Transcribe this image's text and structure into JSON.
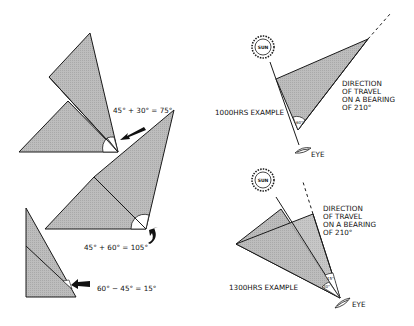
{
  "colors": {
    "fill": "#b9b9b9",
    "stroke": "#1a1a1a",
    "background": "#ffffff"
  },
  "left_panel": {
    "examples": [
      {
        "equation": "45° + 30° = 75°",
        "operation": "add"
      },
      {
        "equation": "45° + 60° = 105°",
        "operation": "add"
      },
      {
        "equation": "60° − 45° = 15°",
        "operation": "subtract"
      }
    ]
  },
  "right_panel": {
    "top": {
      "example_label": "1000HRS EXAMPLE",
      "sun_label": "SUN",
      "eye_label": "EYE",
      "angle_label": "60°",
      "direction_lines": [
        "DIRECTION",
        "OF TRAVEL",
        "ON A BEARING",
        "OF 210°"
      ]
    },
    "bottom": {
      "example_label": "1300HRS EXAMPLE",
      "sun_label": "SUN",
      "eye_label": "EYE",
      "angle_labels": [
        "15°",
        "30°"
      ],
      "direction_lines": [
        "DIRECTION",
        "OF TRAVEL",
        "ON A BEARING",
        "OF 210°"
      ]
    }
  }
}
